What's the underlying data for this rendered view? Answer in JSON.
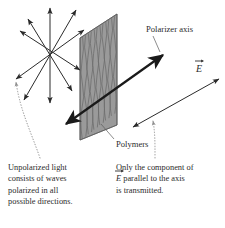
{
  "figure": {
    "background_color": "#ffffff",
    "width": 225,
    "height": 228
  },
  "colors": {
    "ink": "#2b2b2b",
    "sheet_fill": "#9a9a9a",
    "sheet_edge": "#5c5c5c",
    "polymer_line": "#6a6a6a",
    "arrow_thin": "#2b2b2b",
    "arrow_thick": "#1a1a1a",
    "leader_dotted": "#8d8d8d"
  },
  "labels": {
    "polarizer_axis": "Polarizer axis",
    "polymers": "Polymers",
    "e_field": "E",
    "e_field_accent": "vector-arrow"
  },
  "captions": {
    "left": {
      "lines": [
        "Unpolarized light",
        "consists of waves",
        "polarized in all",
        "possible directions."
      ]
    },
    "right": {
      "line1": "Only the component of",
      "line2_vec": "E",
      "line2_rest": " parallel to the axis",
      "line3": "is transmitted."
    }
  },
  "elements": {
    "unpolarized_starburst": {
      "name": "unpolarized-light-starburst",
      "center": [
        50,
        55
      ],
      "description": "double-headed arrows radiating in all directions",
      "ray_count": 5
    },
    "polarizer_sheet": {
      "name": "polarizer-sheet",
      "corners": [
        [
          80,
          38
        ],
        [
          117,
          14
        ],
        [
          117,
          125
        ],
        [
          80,
          140
        ]
      ],
      "polymer_line_count": 13
    },
    "polarizer_axis_arrow": {
      "name": "polarizer-axis-arrow",
      "from": [
        66,
        123
      ],
      "to": [
        162,
        56
      ],
      "double_headed": true
    },
    "transmitted_e_arrow": {
      "name": "transmitted-e-field-arrow",
      "from": [
        134,
        125
      ],
      "to": [
        218,
        80
      ],
      "double_headed": true
    },
    "leader_left": {
      "name": "leader-line-unpolarized",
      "style": "dotted-curve"
    },
    "leader_right": {
      "name": "leader-line-transmitted",
      "style": "dotted-curve"
    },
    "leader_polymers": {
      "name": "leader-line-polymers",
      "style": "solid"
    }
  }
}
